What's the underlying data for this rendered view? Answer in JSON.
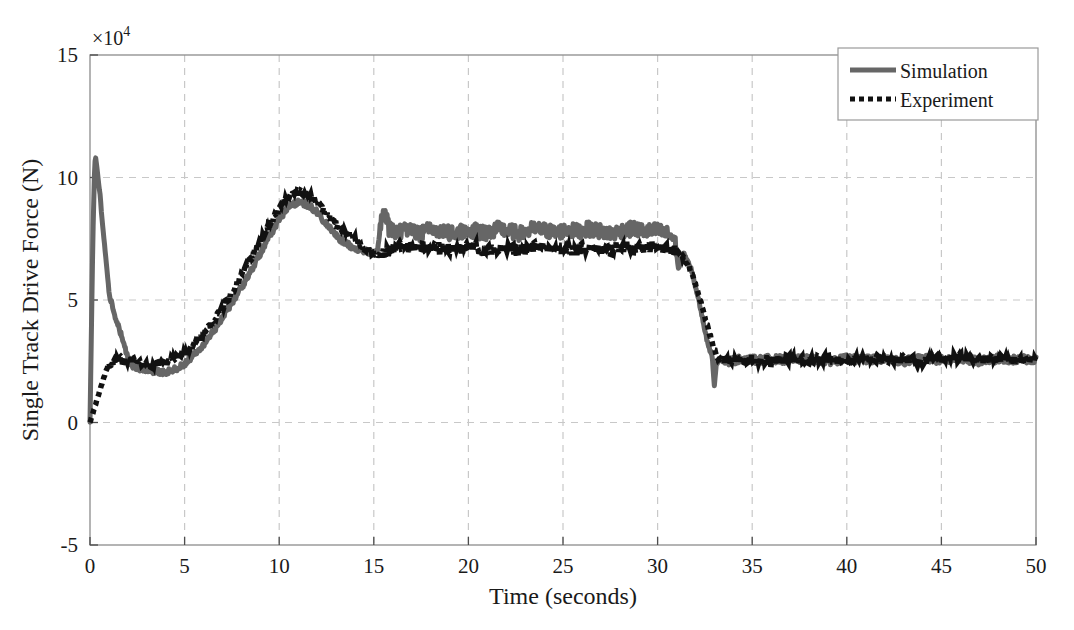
{
  "chart_data": {
    "type": "line",
    "title": "",
    "xlabel": "Time (seconds)",
    "ylabel": "Single Track Drive Force (N)",
    "y_multiplier": "×10",
    "y_multiplier_exponent": "4",
    "xlim": [
      0,
      50
    ],
    "ylim": [
      -5,
      15
    ],
    "xticks": [
      0,
      5,
      10,
      15,
      20,
      25,
      30,
      35,
      40,
      45,
      50
    ],
    "yticks": [
      -5,
      0,
      5,
      10,
      15
    ],
    "xtick_labels": [
      "0",
      "5",
      "10",
      "15",
      "20",
      "25",
      "30",
      "35",
      "40",
      "45",
      "50"
    ],
    "ytick_labels": [
      "-5",
      "0",
      "5",
      "10",
      "15"
    ],
    "grid": true,
    "grid_style": "dashed",
    "grid_color": "#c8c8c8",
    "legend_position": "top-right",
    "legend": [
      {
        "name": "Simulation",
        "style": "solid",
        "color": "#666666",
        "width": 5
      },
      {
        "name": "Experiment",
        "style": "dotted",
        "color": "#111111",
        "width": 5
      }
    ],
    "series": [
      {
        "name": "Simulation",
        "style": "solid",
        "color": "#666666",
        "x": [
          0.0,
          0.15,
          0.25,
          0.3,
          0.35,
          0.45,
          0.55,
          0.6,
          0.7,
          0.8,
          0.9,
          1.0,
          1.2,
          1.5,
          1.8,
          2.0,
          2.3,
          2.6,
          3.0,
          3.4,
          3.8,
          4.2,
          4.6,
          5.0,
          5.5,
          6.0,
          6.5,
          7.0,
          7.5,
          8.0,
          8.5,
          9.0,
          9.5,
          10.0,
          10.5,
          11.0,
          11.3,
          11.6,
          12.0,
          12.4,
          12.8,
          13.2,
          13.6,
          14.0,
          14.4,
          14.8,
          15.2,
          15.4,
          15.6,
          15.8,
          16.2,
          16.8,
          17.4,
          18.0,
          18.6,
          19.2,
          19.8,
          20.4,
          21.0,
          21.6,
          22.2,
          22.8,
          23.4,
          24.0,
          24.6,
          25.2,
          25.8,
          26.4,
          27.0,
          27.6,
          28.2,
          28.8,
          29.4,
          30.0,
          30.5,
          30.9,
          31.1,
          31.4,
          31.8,
          32.2,
          32.6,
          32.9,
          33.0,
          33.1,
          33.3,
          33.8,
          34.5,
          35.2,
          36.0,
          37.0,
          38.0,
          39.0,
          40.0,
          41.0,
          42.0,
          43.0,
          44.0,
          45.0,
          46.0,
          47.0,
          48.0,
          49.0,
          50.0
        ],
        "y": [
          0.0,
          7.5,
          10.6,
          10.8,
          10.5,
          9.8,
          9.2,
          8.6,
          7.8,
          7.0,
          6.2,
          5.4,
          4.6,
          3.9,
          3.2,
          2.6,
          2.3,
          2.2,
          2.15,
          2.1,
          2.05,
          2.1,
          2.2,
          2.4,
          2.8,
          3.2,
          3.7,
          4.3,
          4.9,
          5.5,
          6.2,
          6.9,
          7.6,
          8.3,
          8.8,
          9.0,
          8.95,
          8.85,
          8.6,
          8.2,
          7.8,
          7.5,
          7.3,
          7.1,
          7.0,
          6.95,
          7.0,
          8.3,
          8.6,
          7.9,
          7.8,
          7.85,
          7.7,
          7.9,
          7.8,
          7.7,
          7.85,
          7.8,
          7.75,
          7.9,
          7.8,
          7.7,
          7.9,
          7.85,
          7.75,
          7.85,
          7.8,
          7.9,
          7.8,
          7.7,
          7.85,
          7.9,
          7.8,
          7.85,
          7.7,
          7.5,
          6.3,
          6.9,
          6.2,
          4.9,
          3.4,
          2.6,
          1.5,
          2.4,
          2.6,
          2.5,
          2.6,
          2.55,
          2.6,
          2.55,
          2.6,
          2.5,
          2.6,
          2.55,
          2.6,
          2.5,
          2.6,
          2.55,
          2.6,
          2.5,
          2.6,
          2.55,
          2.6
        ]
      },
      {
        "name": "Experiment",
        "style": "dotted",
        "color": "#111111",
        "x": [
          0.0,
          0.2,
          0.4,
          0.6,
          0.8,
          1.0,
          1.3,
          1.6,
          2.0,
          2.4,
          2.8,
          3.2,
          3.6,
          4.0,
          4.5,
          5.0,
          5.5,
          6.0,
          6.5,
          7.0,
          7.5,
          8.0,
          8.5,
          9.0,
          9.5,
          10.0,
          10.4,
          10.8,
          11.2,
          11.6,
          12.0,
          12.4,
          12.8,
          13.2,
          13.6,
          14.0,
          14.4,
          14.8,
          15.2,
          15.6,
          16.0,
          16.6,
          17.2,
          17.8,
          18.4,
          19.0,
          19.6,
          20.2,
          20.8,
          21.4,
          22.0,
          22.6,
          23.2,
          23.8,
          24.4,
          25.0,
          25.6,
          26.2,
          26.8,
          27.4,
          28.0,
          28.6,
          29.2,
          29.8,
          30.4,
          30.9,
          31.3,
          31.7,
          32.1,
          32.5,
          32.9,
          33.2,
          33.6,
          34.2,
          35.0,
          36.0,
          37.0,
          38.0,
          39.0,
          40.0,
          41.0,
          42.0,
          43.0,
          44.0,
          45.0,
          46.0,
          47.0,
          48.0,
          49.0,
          50.0
        ],
        "y": [
          0.0,
          0.5,
          1.0,
          1.5,
          2.0,
          2.4,
          2.5,
          2.6,
          2.5,
          2.6,
          2.4,
          2.3,
          2.4,
          2.5,
          2.6,
          2.8,
          3.2,
          3.6,
          4.1,
          4.7,
          5.3,
          6.0,
          6.7,
          7.4,
          8.1,
          8.7,
          9.2,
          9.35,
          9.4,
          9.3,
          9.0,
          8.6,
          8.2,
          7.9,
          7.7,
          7.5,
          7.2,
          7.0,
          6.8,
          6.9,
          7.1,
          7.2,
          7.15,
          7.1,
          7.2,
          7.05,
          7.1,
          7.2,
          7.0,
          7.1,
          7.15,
          7.0,
          7.1,
          7.2,
          7.05,
          7.1,
          7.0,
          7.15,
          7.1,
          7.0,
          7.2,
          7.15,
          7.1,
          7.2,
          7.1,
          7.0,
          6.8,
          6.3,
          5.4,
          4.3,
          3.2,
          2.6,
          2.5,
          2.55,
          2.6,
          2.5,
          2.6,
          2.55,
          2.6,
          2.5,
          2.65,
          2.55,
          2.6,
          2.5,
          2.6,
          2.65,
          2.55,
          2.6,
          2.5,
          2.6
        ]
      }
    ]
  }
}
